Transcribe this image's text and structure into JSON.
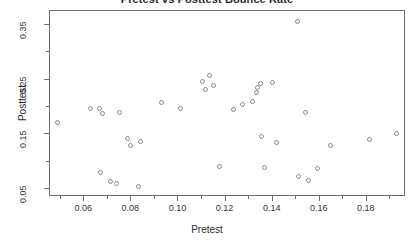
{
  "chart_data": {
    "type": "scatter",
    "title": "Pretest vs Posttest Bounce Rate",
    "xlabel": "Pretest",
    "ylabel": "Posttest",
    "xlim": [
      0.0455,
      0.1966
    ],
    "ylim": [
      0.0355,
      0.3755
    ],
    "grid": false,
    "legend": null,
    "xticks": [
      0.06,
      0.08,
      0.1,
      0.12,
      0.14,
      0.16,
      0.18
    ],
    "xticklabels": [
      "0.06",
      "0.08",
      "0.10",
      "0.12",
      "0.14",
      "0.16",
      "0.18"
    ],
    "xminorticks": [
      0.05,
      0.07,
      0.09,
      0.11,
      0.13,
      0.15,
      0.17,
      0.19
    ],
    "yticks": [
      0.05,
      0.15,
      0.25,
      0.35
    ],
    "yticklabels": [
      "0.05",
      "0.15",
      "0.25",
      "0.35"
    ],
    "yminorticks": [
      0.1,
      0.2,
      0.3
    ],
    "marker": "open-circle",
    "marker_color": "#8a8a8a",
    "points": [
      {
        "x": 0.0492,
        "y": 0.17
      },
      {
        "x": 0.063,
        "y": 0.196
      },
      {
        "x": 0.067,
        "y": 0.196
      },
      {
        "x": 0.068,
        "y": 0.186
      },
      {
        "x": 0.0672,
        "y": 0.078
      },
      {
        "x": 0.0718,
        "y": 0.062
      },
      {
        "x": 0.0742,
        "y": 0.058
      },
      {
        "x": 0.0755,
        "y": 0.188
      },
      {
        "x": 0.079,
        "y": 0.14
      },
      {
        "x": 0.08,
        "y": 0.128
      },
      {
        "x": 0.0835,
        "y": 0.052
      },
      {
        "x": 0.0845,
        "y": 0.136
      },
      {
        "x": 0.0932,
        "y": 0.206
      },
      {
        "x": 0.1015,
        "y": 0.195
      },
      {
        "x": 0.1105,
        "y": 0.245
      },
      {
        "x": 0.1118,
        "y": 0.23
      },
      {
        "x": 0.1135,
        "y": 0.256
      },
      {
        "x": 0.1152,
        "y": 0.237
      },
      {
        "x": 0.118,
        "y": 0.089
      },
      {
        "x": 0.124,
        "y": 0.193
      },
      {
        "x": 0.1275,
        "y": 0.203
      },
      {
        "x": 0.132,
        "y": 0.208
      },
      {
        "x": 0.1335,
        "y": 0.224
      },
      {
        "x": 0.134,
        "y": 0.233
      },
      {
        "x": 0.1352,
        "y": 0.242
      },
      {
        "x": 0.1358,
        "y": 0.145
      },
      {
        "x": 0.1368,
        "y": 0.088
      },
      {
        "x": 0.1405,
        "y": 0.243
      },
      {
        "x": 0.1422,
        "y": 0.134
      },
      {
        "x": 0.151,
        "y": 0.354
      },
      {
        "x": 0.1512,
        "y": 0.071
      },
      {
        "x": 0.1545,
        "y": 0.188
      },
      {
        "x": 0.1558,
        "y": 0.064
      },
      {
        "x": 0.1595,
        "y": 0.085
      },
      {
        "x": 0.165,
        "y": 0.128
      },
      {
        "x": 0.1815,
        "y": 0.139
      },
      {
        "x": 0.193,
        "y": 0.149
      }
    ]
  }
}
